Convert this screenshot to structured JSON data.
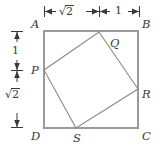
{
  "figure": {
    "type": "geometry-diagram",
    "outer_square": {
      "name": "ABCD",
      "vertices": [
        {
          "label": "A",
          "position": "top-left",
          "x": 44,
          "y": 31
        },
        {
          "label": "B",
          "position": "top-right",
          "x": 138,
          "y": 31
        },
        {
          "label": "C",
          "position": "bottom-right",
          "x": 138,
          "y": 128
        },
        {
          "label": "D",
          "position": "bottom-left",
          "x": 44,
          "y": 128
        }
      ],
      "stroke": "#9a9a9a",
      "stroke_width": 2
    },
    "inner_square": {
      "name": "PQRS",
      "vertices": [
        {
          "label": "Q",
          "on_edge": "AB",
          "x": 99,
          "y": 32
        },
        {
          "label": "R",
          "on_edge": "BC",
          "x": 138,
          "y": 89
        },
        {
          "label": "S",
          "on_edge": "DC",
          "x": 76,
          "y": 128
        },
        {
          "label": "P",
          "on_edge": "AD",
          "x": 44,
          "y": 70
        }
      ],
      "stroke": "#8a8a8a",
      "stroke_width": 1
    },
    "dimensions": {
      "top": {
        "orientation": "horizontal",
        "segments": [
          {
            "label": "√2",
            "value": "sqrt(2)",
            "from_x": 44,
            "to_x": 99
          },
          {
            "label": "1",
            "value": "1",
            "from_x": 99,
            "to_x": 139
          }
        ]
      },
      "left": {
        "orientation": "vertical",
        "segments": [
          {
            "label": "1",
            "value": "1",
            "from_y": 31,
            "to_y": 70
          },
          {
            "label": "√2",
            "value": "sqrt(2)",
            "from_y": 70,
            "to_y": 128
          }
        ]
      }
    },
    "labels": {
      "A": "A",
      "B": "B",
      "C": "C",
      "D": "D",
      "P": "P",
      "Q": "Q",
      "R": "R",
      "S": "S",
      "dim_top_left": "2",
      "dim_top_right": "1",
      "dim_left_top": "1",
      "dim_left_bottom": "2"
    },
    "colors": {
      "outer_stroke": "#9a9a9a",
      "inner_stroke": "#8a8a8a",
      "dimension_stroke": "#3a3a3a",
      "text": "#3a3a3a",
      "background": "#ffffff"
    }
  }
}
